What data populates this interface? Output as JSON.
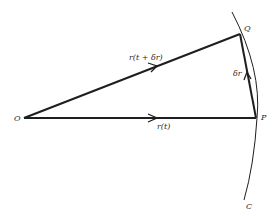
{
  "diagram": {
    "type": "vector-displacement",
    "colors": {
      "stroke": "#1e1e1e",
      "background": "#ffffff"
    },
    "points": {
      "O": {
        "label": "O",
        "x": 24,
        "y": 118
      },
      "P": {
        "label": "P",
        "x": 256,
        "y": 118
      },
      "Q": {
        "label": "Q",
        "x": 240,
        "y": 34
      }
    },
    "vectors": [
      {
        "from": "O",
        "to": "Q",
        "label": "r(t + δr)"
      },
      {
        "from": "O",
        "to": "P",
        "label": "r(t)"
      },
      {
        "from": "P",
        "to": "Q",
        "label": "δr"
      }
    ],
    "curve": {
      "label": "C"
    },
    "labels": {
      "O": "O",
      "P": "P",
      "Q": "Q",
      "C": "C",
      "r_t_plus": "r(t + δr)",
      "r_t": "r(t)",
      "delta_r": "δr"
    }
  }
}
